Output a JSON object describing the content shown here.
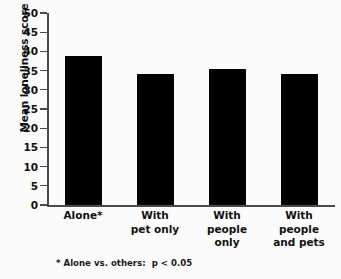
{
  "chart_data": {
    "type": "bar",
    "title": "",
    "subtitle": "",
    "xlabel": "",
    "ylabel": "Mean loneliness score",
    "categories": [
      "Alone*",
      "With pet only",
      "With people only",
      "With people and pets"
    ],
    "category_lines": [
      [
        "Alone*"
      ],
      [
        "With",
        "pet only"
      ],
      [
        "With",
        "people",
        "only"
      ],
      [
        "With",
        "people",
        "and pets"
      ]
    ],
    "values": [
      38.8,
      34.1,
      35.5,
      34.1
    ],
    "ylim": [
      0,
      50
    ],
    "ytick_step": 5,
    "yticks": [
      50,
      45,
      40,
      35,
      30,
      25,
      20,
      15,
      10,
      5,
      0
    ],
    "ytick_labels": [
      "50",
      "45",
      "40",
      "35",
      "30",
      "25",
      "20",
      "15",
      "10",
      "5",
      "0"
    ],
    "grid": false,
    "legend": null,
    "legend_position": "none",
    "bar_color": "#000000",
    "axis_color": "#4a4a4a",
    "text_color": "#111111",
    "background_color": "#fbfbfb",
    "annotations": [
      {
        "name": "significance-footnote",
        "text": "* Alone vs. others:  p < 0.05"
      }
    ]
  }
}
